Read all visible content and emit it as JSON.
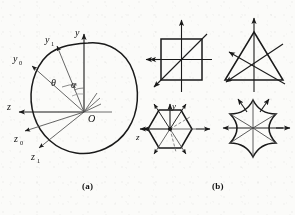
{
  "figure": {
    "panels": [
      {
        "caption": "(a)",
        "description": "closed convex contour with body-fixed and rotating coordinate axes about origin O",
        "origin_label": "O",
        "axis_labels": [
          {
            "name": "y",
            "text": "y"
          },
          {
            "name": "y0",
            "text": "y",
            "sub": "0"
          },
          {
            "name": "y1",
            "text": "y",
            "sub": "1"
          },
          {
            "name": "z",
            "text": "z"
          },
          {
            "name": "z0",
            "text": "z",
            "sub": "0"
          },
          {
            "name": "z1",
            "text": "z",
            "sub": "1"
          }
        ],
        "angle_labels": [
          {
            "name": "theta",
            "text": "θ"
          },
          {
            "name": "alpha",
            "text": "α"
          }
        ]
      },
      {
        "caption": "(b)",
        "description": "four symmetric cross-sections with symmetry axes and arrow vectors",
        "shapes": [
          {
            "name": "square",
            "label": "square with diagonal axis and two arrows"
          },
          {
            "name": "triangle",
            "label": "equilateral triangle with three symmetry axes and arrows"
          },
          {
            "name": "hexagon",
            "label": "regular hexagon with y and z axes, dashed diagonals and arrows"
          },
          {
            "name": "concave-star",
            "label": "six-pointed concave star with symmetry axes and arrows"
          }
        ],
        "hexagon_axis_labels": [
          {
            "name": "y",
            "text": "y"
          },
          {
            "name": "z",
            "text": "z"
          }
        ]
      }
    ],
    "colors": {
      "ink": "#1a1a1a",
      "line": "#2a2a2a",
      "thin": "#4a4a4a",
      "paper": "#fbfbf9"
    }
  }
}
